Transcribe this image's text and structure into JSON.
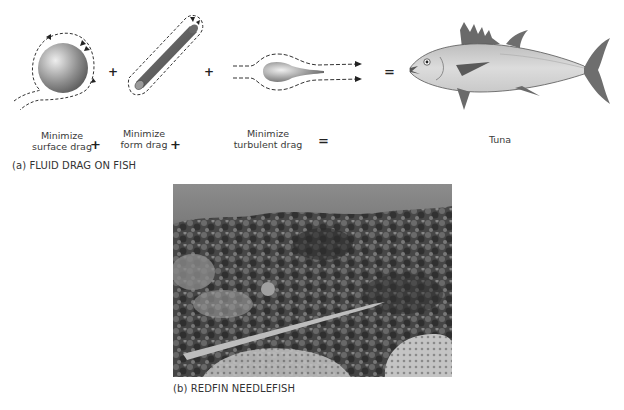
{
  "panel_a": {
    "caption": "(a) FLUID DRAG ON FISH",
    "terms": [
      {
        "line1": "Minimize",
        "line2": "surface drag",
        "icon": "sphere-flow-icon"
      },
      {
        "line1": "Minimize",
        "line2": "form drag",
        "icon": "cylinder-flow-icon"
      },
      {
        "line1": "Minimize",
        "line2": "turbulent drag",
        "icon": "teardrop-flow-icon"
      }
    ],
    "operators": [
      "+",
      "+",
      "="
    ],
    "result": {
      "label": "Tuna",
      "icon": "tuna-icon"
    }
  },
  "panel_b": {
    "caption": "(b) REDFIN NEEDLEFISH"
  },
  "colors": {
    "shape_dark": "#5a5a5a",
    "shape_light": "#cfcfcf",
    "tuna_body": "#d4d4d4",
    "fin": "#6e6e6e",
    "photo_water": "#8a8a8a",
    "photo_coral": "#3f3f3f"
  }
}
